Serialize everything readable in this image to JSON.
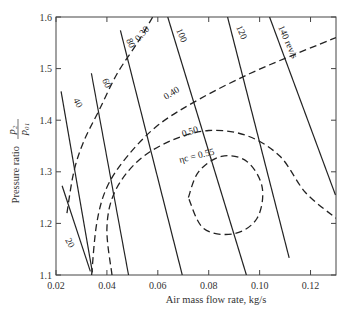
{
  "chart_data": {
    "type": "line",
    "title": "",
    "xlabel": "Air mass flow rate, kg/s",
    "ylabel": "Pressure ratio p2/p01",
    "ylabel_prefix": "Pressure ratio",
    "ylabel_frac_num": "p₂",
    "ylabel_frac_den": "p₀₁",
    "xlim": [
      0.02,
      0.13
    ],
    "ylim": [
      1.1,
      1.6
    ],
    "x_ticks": [
      0.02,
      0.04,
      0.06,
      0.08,
      0.1,
      0.12
    ],
    "x_tick_labels": [
      "0.02",
      "0.04",
      "0.06",
      "0.08",
      "0.10",
      "0.12"
    ],
    "y_ticks": [
      1.1,
      1.2,
      1.3,
      1.4,
      1.5,
      1.6
    ],
    "y_tick_labels": [
      "1.1",
      "1.2",
      "1.3",
      "1.4",
      "1.5",
      "1.6"
    ],
    "grid": false,
    "legend": "none (curves labeled inline)",
    "speed_lines": {
      "style": "solid",
      "unit": "rev/s",
      "series": [
        {
          "name": "20",
          "label": "20",
          "points": [
            [
              0.0224,
              1.273
            ],
            [
              0.0335,
              1.107
            ]
          ]
        },
        {
          "name": "40",
          "label": "40",
          "points": [
            [
              0.022,
              1.456
            ],
            [
              0.0343,
              1.105
            ]
          ]
        },
        {
          "name": "60",
          "label": "60",
          "points": [
            [
              0.0339,
              1.491
            ],
            [
              0.0485,
              1.1
            ]
          ]
        },
        {
          "name": "80",
          "label": "80",
          "points": [
            [
              0.0453,
              1.574
            ],
            [
              0.0696,
              1.1
            ]
          ]
        },
        {
          "name": "100",
          "label": "100",
          "points": [
            [
              0.0639,
              1.6
            ],
            [
              0.0948,
              1.1
            ]
          ]
        },
        {
          "name": "120",
          "label": "120",
          "points": [
            [
              0.0874,
              1.6
            ],
            [
              0.1116,
              1.133
            ]
          ]
        },
        {
          "name": "140",
          "label": "140 rev/s",
          "points": [
            [
              0.1039,
              1.6
            ],
            [
              0.1298,
              1.255
            ]
          ]
        }
      ]
    },
    "efficiency_contours": {
      "style": "dashed",
      "symbol": "ηc",
      "series": [
        {
          "name": "0.30",
          "label": "0.30",
          "points": [
            [
              0.0243,
              1.22
            ],
            [
              0.027,
              1.3
            ],
            [
              0.031,
              1.36
            ],
            [
              0.037,
              1.42
            ],
            [
              0.044,
              1.49
            ],
            [
              0.052,
              1.55
            ],
            [
              0.058,
              1.6
            ]
          ]
        },
        {
          "name": "0.40",
          "label": "0.40",
          "points": [
            [
              0.034,
              1.1
            ],
            [
              0.036,
              1.2
            ],
            [
              0.04,
              1.27
            ],
            [
              0.048,
              1.33
            ],
            [
              0.06,
              1.39
            ],
            [
              0.076,
              1.44
            ],
            [
              0.096,
              1.49
            ],
            [
              0.115,
              1.53
            ],
            [
              0.13,
              1.56
            ]
          ]
        },
        {
          "name": "0.50",
          "label": "0.50",
          "points": [
            [
              0.042,
              1.1
            ],
            [
              0.04,
              1.19
            ],
            [
              0.043,
              1.26
            ],
            [
              0.052,
              1.32
            ],
            [
              0.065,
              1.36
            ],
            [
              0.08,
              1.38
            ],
            [
              0.095,
              1.37
            ],
            [
              0.108,
              1.33
            ],
            [
              0.118,
              1.26
            ],
            [
              0.13,
              1.21
            ]
          ]
        },
        {
          "name": "0.55",
          "label": "ηc = 0.55",
          "points": [
            [
              0.072,
              1.25
            ],
            [
              0.076,
              1.3
            ],
            [
              0.085,
              1.33
            ],
            [
              0.095,
              1.32
            ],
            [
              0.101,
              1.27
            ],
            [
              0.099,
              1.21
            ],
            [
              0.09,
              1.18
            ],
            [
              0.078,
              1.19
            ],
            [
              0.072,
              1.25
            ]
          ]
        }
      ]
    }
  }
}
